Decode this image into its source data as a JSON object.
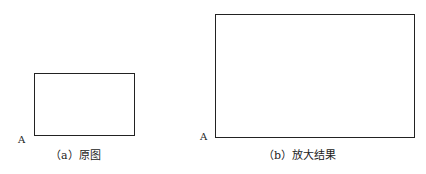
{
  "figures": [
    {
      "id": "a",
      "caption": "（a）原图",
      "corner_label": "A"
    },
    {
      "id": "b",
      "caption": "（b）放大结果",
      "corner_label": "A"
    }
  ]
}
